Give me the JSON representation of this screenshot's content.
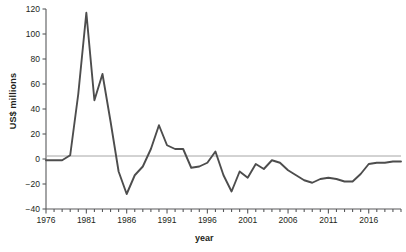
{
  "chart_data": {
    "type": "line",
    "title": "",
    "xlabel": "year",
    "ylabel": "US$ millions",
    "xlim": [
      1976,
      2020
    ],
    "ylim": [
      -40,
      120
    ],
    "yticks": [
      -40,
      -20,
      0,
      20,
      40,
      60,
      80,
      100,
      120
    ],
    "ytick_labels": [
      "−40",
      "−20",
      "0",
      "20",
      "40",
      "60",
      "80",
      "100",
      "120"
    ],
    "xticks_labeled": [
      1976,
      1981,
      1986,
      1991,
      1996,
      2001,
      2006,
      2011,
      2016
    ],
    "xtick_interval": 1,
    "grid": false,
    "legend": null,
    "zero_line": true,
    "line_color": "#4d4d4d",
    "zero_line_color": "#a6a6a6",
    "axis_color": "#58595b",
    "x": [
      1976,
      1977,
      1978,
      1979,
      1980,
      1981,
      1982,
      1983,
      1984,
      1985,
      1986,
      1987,
      1988,
      1989,
      1990,
      1991,
      1992,
      1993,
      1994,
      1995,
      1996,
      1997,
      1998,
      1999,
      2000,
      2001,
      2002,
      2003,
      2004,
      2005,
      2006,
      2007,
      2008,
      2009,
      2010,
      2011,
      2012,
      2013,
      2014,
      2015,
      2016,
      2017,
      2018,
      2019,
      2020
    ],
    "values": [
      -1,
      -1,
      -1,
      3,
      52,
      117,
      47,
      68,
      30,
      -10,
      -28,
      -13,
      -6,
      8,
      27,
      11,
      8,
      8,
      -7,
      -6,
      -3,
      6,
      -13,
      -26,
      -10,
      -15,
      -4,
      -8,
      -1,
      -3,
      -9,
      -13,
      -17,
      -19,
      -16,
      -15,
      -16,
      -18,
      -18,
      -12,
      -4,
      -3,
      -3,
      -2,
      -2
    ]
  },
  "axis_labels": {
    "y": "US$ millions",
    "x": "year"
  },
  "caption": ""
}
